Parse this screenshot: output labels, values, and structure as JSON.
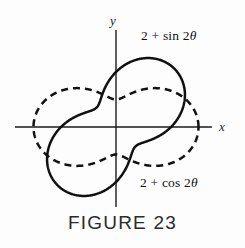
{
  "figure": {
    "caption": "FIGURE 23",
    "axes": {
      "x_label": "x",
      "y_label": "y",
      "origin": {
        "x": 116,
        "y": 127
      },
      "x_axis_from": 15,
      "x_axis_to": 212,
      "y_axis_from": 30,
      "y_axis_to": 207,
      "unit_px": 27.5
    },
    "stroke_color": "#111111",
    "background_color": "#fdfdfd"
  },
  "curves": [
    {
      "name": "solid-curve",
      "label": "2 + sin 2θ",
      "label_prefix": "2 + sin 2",
      "label_symbol": "θ",
      "style": "solid",
      "equation": "r = 2 + sin 2θ"
    },
    {
      "name": "dashed-curve",
      "label": "2 + cos 2θ",
      "label_prefix": "2 + cos 2",
      "label_symbol": "θ",
      "style": "dashed",
      "equation": "r = 2 + cos 2θ"
    }
  ],
  "chart_data": {
    "type": "line",
    "title": "FIGURE 23",
    "subtitle": "",
    "coordinate_system": "polar",
    "xlabel": "x",
    "ylabel": "y",
    "grid": false,
    "legend": "inline-annotations",
    "xlim": [
      -3.7,
      3.5
    ],
    "ylim": [
      -2.9,
      3.6
    ],
    "annotations": [
      {
        "text": "2 + sin 2θ",
        "target": "solid-curve",
        "position": "upper-right"
      },
      {
        "text": "2 + cos 2θ",
        "target": "dashed-curve",
        "position": "lower-right"
      }
    ],
    "series": [
      {
        "name": "2 + sin 2θ",
        "style": "solid",
        "equation_polar": "r = 2 + sin(2*theta)",
        "theta_degrees": [
          0,
          15,
          30,
          45,
          60,
          75,
          90,
          105,
          120,
          135,
          150,
          165,
          180,
          195,
          210,
          225,
          240,
          255,
          270,
          285,
          300,
          315,
          330,
          345,
          360
        ],
        "r": [
          2.0,
          2.5,
          2.87,
          3.0,
          2.87,
          2.5,
          2.0,
          1.5,
          1.13,
          1.0,
          1.13,
          1.5,
          2.0,
          2.5,
          2.87,
          3.0,
          2.87,
          2.5,
          2.0,
          1.5,
          1.13,
          1.0,
          1.13,
          1.5,
          2.0
        ],
        "r_max": 3.0,
        "r_min": 1.0,
        "max_at_theta_degrees": [
          45,
          225
        ],
        "min_at_theta_degrees": [
          135,
          315
        ]
      },
      {
        "name": "2 + cos 2θ",
        "style": "dashed",
        "equation_polar": "r = 2 + cos(2*theta)",
        "theta_degrees": [
          0,
          15,
          30,
          45,
          60,
          75,
          90,
          105,
          120,
          135,
          150,
          165,
          180,
          195,
          210,
          225,
          240,
          255,
          270,
          285,
          300,
          315,
          330,
          345,
          360
        ],
        "r": [
          3.0,
          2.87,
          2.5,
          2.0,
          1.5,
          1.13,
          1.0,
          1.13,
          1.5,
          2.0,
          2.5,
          2.87,
          3.0,
          2.87,
          2.5,
          2.0,
          1.5,
          1.13,
          1.0,
          1.13,
          1.5,
          2.0,
          2.5,
          2.87,
          3.0
        ],
        "r_max": 3.0,
        "r_min": 1.0,
        "max_at_theta_degrees": [
          0,
          180
        ],
        "min_at_theta_degrees": [
          90,
          270
        ]
      }
    ]
  }
}
